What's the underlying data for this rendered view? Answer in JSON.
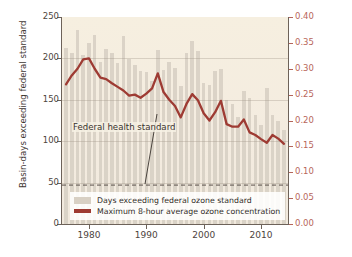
{
  "chart_data": {
    "type": "bar",
    "title": "",
    "subtitle": "",
    "xlabel": "",
    "ylabel": "Basin-days exceeding federal standard",
    "y2label": "Maximum concentration (ppm)",
    "ylim": [
      0,
      250
    ],
    "y2lim": [
      0.0,
      0.4
    ],
    "xlim": [
      1975.3,
      2014.7
    ],
    "grid": true,
    "legend_position": "inside bottom-left",
    "x_ticks": [
      "1980",
      "1990",
      "2000",
      "2010"
    ],
    "x_tick_values": [
      1980,
      1990,
      2000,
      2010
    ],
    "y_ticks": [
      "0",
      "50",
      "100",
      "150",
      "200",
      "250"
    ],
    "y_tick_values": [
      0,
      50,
      100,
      150,
      200,
      250
    ],
    "y2_ticks": [
      "0.00",
      "0.05",
      "0.10",
      "0.15",
      "0.20",
      "0.25",
      "0.30",
      "0.35",
      "0.40"
    ],
    "y2_tick_values": [
      0.0,
      0.05,
      0.1,
      0.15,
      0.2,
      0.25,
      0.3,
      0.35,
      0.4
    ],
    "x": [
      1976,
      1977,
      1978,
      1979,
      1980,
      1981,
      1982,
      1983,
      1984,
      1985,
      1986,
      1987,
      1988,
      1989,
      1990,
      1991,
      1992,
      1993,
      1994,
      1995,
      1996,
      1997,
      1998,
      1999,
      2000,
      2001,
      2002,
      2003,
      2004,
      2005,
      2006,
      2007,
      2008,
      2009,
      2010,
      2011,
      2012,
      2013,
      2014
    ],
    "annotations": [
      {
        "text": "Federal health standard",
        "y_value": 47,
        "kind": "dashed-hline-with-leader"
      }
    ],
    "series": [
      {
        "name": "Days exceeding federal ozone standard",
        "type": "bar",
        "axis": "left",
        "color": "#d8d0c4",
        "values": [
          212,
          207,
          234,
          204,
          219,
          228,
          196,
          211,
          206,
          194,
          227,
          199,
          192,
          185,
          184,
          173,
          210,
          186,
          196,
          188,
          167,
          206,
          221,
          209,
          170,
          168,
          185,
          187,
          150,
          145,
          129,
          161,
          152,
          132,
          120,
          164,
          132,
          125,
          114
        ]
      },
      {
        "name": "Maximum 8-hour average ozone concentration",
        "type": "line",
        "axis": "right",
        "color": "#9e3b33",
        "values": [
          0.27,
          0.287,
          0.3,
          0.318,
          0.32,
          0.3,
          0.283,
          0.28,
          0.272,
          0.265,
          0.258,
          0.248,
          0.25,
          0.244,
          0.252,
          0.262,
          0.291,
          0.255,
          0.24,
          0.228,
          0.206,
          0.232,
          0.251,
          0.239,
          0.214,
          0.2,
          0.216,
          0.238,
          0.193,
          0.188,
          0.188,
          0.202,
          0.177,
          0.172,
          0.164,
          0.157,
          0.172,
          0.165,
          0.155
        ]
      }
    ]
  },
  "legend": {
    "items": [
      {
        "label": "Days exceeding federal ozone standard",
        "swatch": "bar"
      },
      {
        "label": "Maximum 8-hour average ozone concentration",
        "swatch": "line"
      }
    ]
  },
  "colors": {
    "bar": "#d8d0c4",
    "line": "#9e3b33",
    "plot_background": "#f5eee1",
    "left_axis_text": "#3f3833",
    "right_axis_text": "#b8665b"
  }
}
